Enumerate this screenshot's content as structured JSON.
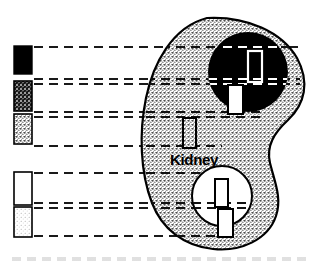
{
  "figure": {
    "organ_label": "Kidney",
    "width": 325,
    "height": 262,
    "background_color": "#ffffff",
    "outline_color": "#000000"
  },
  "colors": {
    "black": "#000000",
    "white": "#ffffff",
    "stipple_light": "#d9d9d9",
    "stipple_dark": "#2a2a2a",
    "leader_line": "#1a1a1a"
  },
  "legend": {
    "swatches": [
      {
        "id": "swatch-black",
        "fill_style": "solid-black",
        "fill_color": "#000000",
        "x": 14,
        "y": 46,
        "width": 18,
        "height": 28
      },
      {
        "id": "swatch-dark-speckled",
        "fill_style": "dark-speckled",
        "fill_color": "#2a2a2a",
        "x": 14,
        "y": 81,
        "width": 18,
        "height": 30
      },
      {
        "id": "swatch-light-speckled",
        "fill_style": "light-speckled",
        "fill_color": "#d9d9d9",
        "x": 14,
        "y": 114,
        "width": 18,
        "height": 30
      },
      {
        "id": "swatch-white",
        "fill_style": "white-outline",
        "fill_color": "#ffffff",
        "x": 14,
        "y": 172,
        "width": 18,
        "height": 33
      },
      {
        "id": "swatch-pale-speckled",
        "fill_style": "pale-speckled",
        "fill_color": "#ececec",
        "x": 14,
        "y": 207,
        "width": 18,
        "height": 30
      }
    ],
    "leader_lines": [
      {
        "id": "leader-1",
        "y": 47,
        "x_start": 34,
        "x_end": 300
      },
      {
        "id": "leader-2",
        "y": 79,
        "x_start": 34,
        "x_end": 300
      },
      {
        "id": "leader-3",
        "y": 84,
        "x_start": 34,
        "x_end": 300
      },
      {
        "id": "leader-4",
        "y": 112,
        "x_start": 34,
        "x_end": 262
      },
      {
        "id": "leader-5",
        "y": 117,
        "x_start": 34,
        "x_end": 262
      },
      {
        "id": "leader-6",
        "y": 146,
        "x_start": 34,
        "x_end": 222
      },
      {
        "id": "leader-7",
        "y": 173,
        "x_start": 34,
        "x_end": 235
      },
      {
        "id": "leader-8",
        "y": 203,
        "x_start": 34,
        "x_end": 248
      },
      {
        "id": "leader-9",
        "y": 208,
        "x_start": 34,
        "x_end": 248
      },
      {
        "id": "leader-10",
        "y": 236,
        "x_start": 34,
        "x_end": 230
      }
    ]
  },
  "regions": {
    "dark_circle": {
      "id": "dark-region",
      "cx": 248,
      "cy": 72,
      "r": 40,
      "fill_color": "#000000"
    },
    "light_circle": {
      "id": "light-region",
      "cx": 222,
      "cy": 196,
      "r": 30,
      "fill_color": "#ffffff"
    }
  },
  "markers": [
    {
      "id": "marker-dark-inner",
      "x": 248,
      "y": 51,
      "width": 14,
      "height": 31,
      "stroke_color": "#ffffff",
      "fill_color": "none",
      "location": "dark-region"
    },
    {
      "id": "marker-dark-edge",
      "x": 228,
      "y": 85,
      "width": 15,
      "height": 29,
      "stroke_color": "#000000",
      "fill_color": "#ffffff",
      "location": "dark-region-boundary"
    },
    {
      "id": "marker-stroma",
      "x": 183,
      "y": 118,
      "width": 13,
      "height": 30,
      "stroke_color": "#000000",
      "fill_color": "none",
      "location": "stippled-parenchyma"
    },
    {
      "id": "marker-light-inner",
      "x": 215,
      "y": 179,
      "width": 13,
      "height": 28,
      "stroke_color": "#000000",
      "fill_color": "#ffffff",
      "location": "light-region"
    },
    {
      "id": "marker-light-edge",
      "x": 218,
      "y": 209,
      "width": 15,
      "height": 28,
      "stroke_color": "#000000",
      "fill_color": "#ffffff",
      "location": "light-region-boundary"
    }
  ]
}
